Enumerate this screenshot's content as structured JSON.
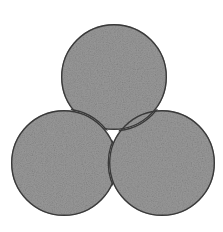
{
  "figure": {
    "name": "triskelion-crescents",
    "background_color": "#ffffff",
    "width": 223,
    "height": 232,
    "symmetry": "3-fold rotational (120 degrees)",
    "title": "",
    "caption": ""
  },
  "style": {
    "fill_color": "#9a9a9a",
    "fill_color_dark": "#8a8a8a",
    "fill_color_light": "#a8a8a8",
    "outline_color": "#3a3a3a",
    "outline_width": 1.4,
    "texture": "mottled-grain"
  },
  "geometry": {
    "disc_radius": 53,
    "center_x": 113.3,
    "center_y": 134.3,
    "discs": [
      {
        "id": "top",
        "label": "Top crescent",
        "cx": 114,
        "cy": 77,
        "r": 53,
        "rotation_deg": 0
      },
      {
        "id": "left",
        "label": "Bottom-left crescent",
        "cx": 64,
        "cy": 163,
        "r": 53,
        "rotation_deg": 120
      },
      {
        "id": "right",
        "label": "Bottom-right crescent",
        "cx": 162,
        "cy": 163,
        "r": 53,
        "rotation_deg": 240
      }
    ]
  },
  "shapes": [
    {
      "id": "crescent-top",
      "name": "crescent-top",
      "label": "Top crescent",
      "fill": "#9a9a9a",
      "stroke": "#3a3a3a",
      "cut_by": "left"
    },
    {
      "id": "crescent-left",
      "name": "crescent-left",
      "label": "Bottom-left crescent",
      "fill": "#9a9a9a",
      "stroke": "#3a3a3a",
      "cut_by": "right"
    },
    {
      "id": "crescent-right",
      "name": "crescent-right",
      "label": "Bottom-right crescent",
      "fill": "#9a9a9a",
      "stroke": "#3a3a3a",
      "cut_by": "top"
    }
  ]
}
